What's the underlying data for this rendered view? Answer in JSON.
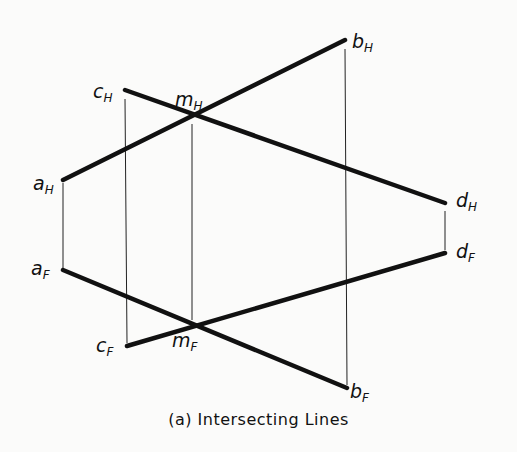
{
  "figure": {
    "caption": "(a)  Intersecting Lines",
    "title": "Intersecting Lines",
    "label": "(a)"
  },
  "views": {
    "horizontal": {
      "points": {
        "a": {
          "main": "a",
          "sub": "H",
          "x": 63,
          "y": 180
        },
        "b": {
          "main": "b",
          "sub": "H",
          "x": 345,
          "y": 40
        },
        "c": {
          "main": "c",
          "sub": "H",
          "x": 125,
          "y": 90
        },
        "d": {
          "main": "d",
          "sub": "H",
          "x": 445,
          "y": 203
        },
        "m": {
          "main": "m",
          "sub": "H",
          "x": 192,
          "y": 115
        }
      },
      "lines": [
        {
          "from": "a",
          "to": "b",
          "name": "line-ab-horizontal"
        },
        {
          "from": "c",
          "to": "d",
          "name": "line-cd-horizontal"
        }
      ]
    },
    "frontal": {
      "points": {
        "a": {
          "main": "a",
          "sub": "F",
          "x": 63,
          "y": 270
        },
        "b": {
          "main": "b",
          "sub": "F",
          "x": 347,
          "y": 388
        },
        "c": {
          "main": "c",
          "sub": "F",
          "x": 127,
          "y": 346
        },
        "d": {
          "main": "d",
          "sub": "F",
          "x": 445,
          "y": 253
        },
        "m": {
          "main": "m",
          "sub": "F",
          "x": 192,
          "y": 327
        }
      },
      "lines": [
        {
          "from": "a",
          "to": "b",
          "name": "line-ab-frontal"
        },
        {
          "from": "c",
          "to": "d",
          "name": "line-cd-frontal"
        }
      ]
    }
  },
  "projectors": [
    {
      "point": "a",
      "x": 63,
      "y1": 183,
      "y2": 268
    },
    {
      "point": "c",
      "x": 125,
      "y1": 99,
      "y2": 343
    },
    {
      "point": "m",
      "x": 192,
      "y1": 124,
      "y2": 320
    },
    {
      "point": "b",
      "x": 345,
      "y1": 49,
      "y2": 385
    },
    {
      "point": "d",
      "x": 445,
      "y1": 211,
      "y2": 250
    }
  ]
}
